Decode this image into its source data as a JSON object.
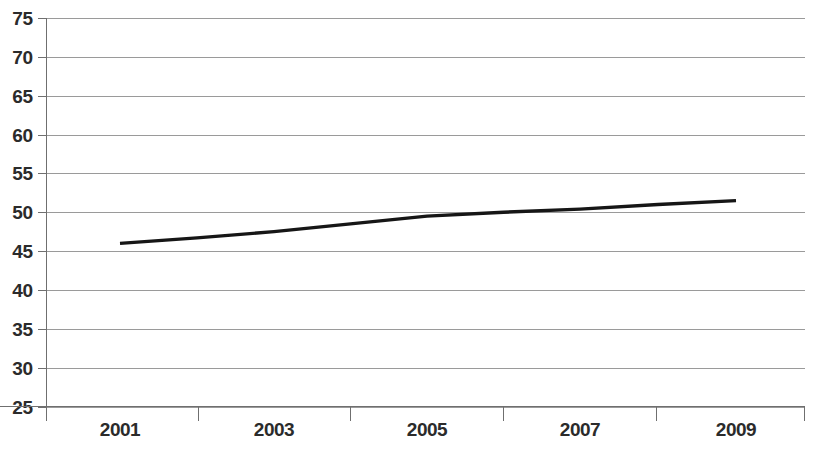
{
  "chart_data": {
    "type": "line",
    "title": "",
    "subtitle": "",
    "xlabel": "",
    "ylabel": "",
    "x": [
      2001,
      2002,
      2003,
      2004,
      2005,
      2006,
      2007,
      2008,
      2009
    ],
    "categories": [
      "2001",
      "2002",
      "2003",
      "2004",
      "2005",
      "2006",
      "2007",
      "2008",
      "2009"
    ],
    "series": [
      {
        "name": "",
        "values": [
          46.0,
          46.7,
          47.5,
          48.5,
          49.5,
          50.0,
          50.4,
          51.0,
          51.5
        ],
        "color": "#161616"
      }
    ],
    "values": [
      46.0,
      46.7,
      47.5,
      48.5,
      49.5,
      50.0,
      50.4,
      51.0,
      51.5
    ],
    "xlim": [
      2000,
      2010
    ],
    "ylim": [
      25,
      75
    ],
    "y_ticks": [
      25,
      30,
      35,
      40,
      45,
      50,
      55,
      60,
      65,
      70,
      75
    ],
    "y_tick_labels": [
      "25",
      "30",
      "35",
      "40",
      "45",
      "50",
      "55",
      "60",
      "65",
      "70",
      "75"
    ],
    "x_tick_labels": [
      "2001",
      "2003",
      "2005",
      "2007",
      "2009"
    ],
    "x_tick_label_positions": [
      2001,
      2003,
      2005,
      2007,
      2009
    ],
    "grid": true,
    "grid_axis": "y",
    "grid_color": "#9a9a9a",
    "axis_color": "#6f6f6f",
    "legend": false,
    "legend_position": "none",
    "background": "#ffffff",
    "annotations": []
  }
}
